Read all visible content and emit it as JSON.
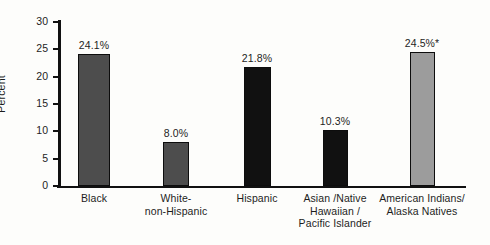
{
  "chart_data": {
    "type": "bar",
    "title": "",
    "xlabel": "",
    "ylabel": "Percent",
    "ylim": [
      0,
      30
    ],
    "yticks": [
      0,
      5,
      10,
      15,
      20,
      25,
      30
    ],
    "ytick_labels": [
      "0",
      "5",
      "10",
      "15",
      "20",
      "25",
      "30"
    ],
    "grid": false,
    "legend": "none",
    "categories": [
      "Black",
      "White-\nnon-Hispanic",
      "Hispanic",
      "Asian /Native\nHawaiian /\nPacific Islander",
      "American Indians/\nAlaska Natives"
    ],
    "values": [
      24.1,
      8.0,
      21.8,
      10.3,
      24.5
    ],
    "data_labels": [
      "24.1%",
      "8.0%",
      "21.8%",
      "10.3%",
      "24.5%*"
    ],
    "bar_colors": [
      "#4d4d4d",
      "#4d4d4d",
      "#111111",
      "#111111",
      "#9c9c9c"
    ],
    "bar_edge_color": "#0d0d0d",
    "annotations": [
      "* value carries a footnote marker"
    ],
    "axis_color": "#111111",
    "background_color": "#fdfdfb"
  }
}
